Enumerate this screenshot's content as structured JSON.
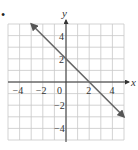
{
  "bullet": "•",
  "chart_data": {
    "type": "line",
    "title": "",
    "xlabel": "x",
    "ylabel": "y",
    "xlim": [
      -5,
      5
    ],
    "ylim": [
      -5,
      5
    ],
    "grid": true,
    "grid_step": 1,
    "x_ticks": [
      -4,
      -2,
      0,
      2,
      4
    ],
    "x_tick_labels": [
      "−4",
      "−2",
      "0",
      "2",
      "4"
    ],
    "y_ticks": [
      4,
      2,
      -2,
      -4
    ],
    "y_tick_labels": [
      "4",
      "2",
      "−2",
      "−4"
    ],
    "series": [
      {
        "name": "y = -x + 2",
        "x": [
          -3,
          5
        ],
        "y": [
          5,
          -3
        ],
        "color": "#666666",
        "arrows": "both"
      }
    ]
  }
}
